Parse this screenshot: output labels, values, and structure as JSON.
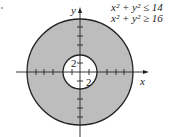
{
  "diagram": {
    "type": "annulus-region-graph",
    "colors": {
      "shaded": "#bdbdbd",
      "stroke": "#222222",
      "background": "#ffffff"
    },
    "axes": {
      "x_label": "x",
      "y_label": "y"
    },
    "inequalities": [
      "x² + y² ≤ 14",
      "x² + y² ≥ 16"
    ],
    "tick_labels": {
      "inner_y": "2",
      "inner_x": "2"
    },
    "circles": {
      "outer_radius_px": 53,
      "inner_radius_px": 17
    }
  }
}
